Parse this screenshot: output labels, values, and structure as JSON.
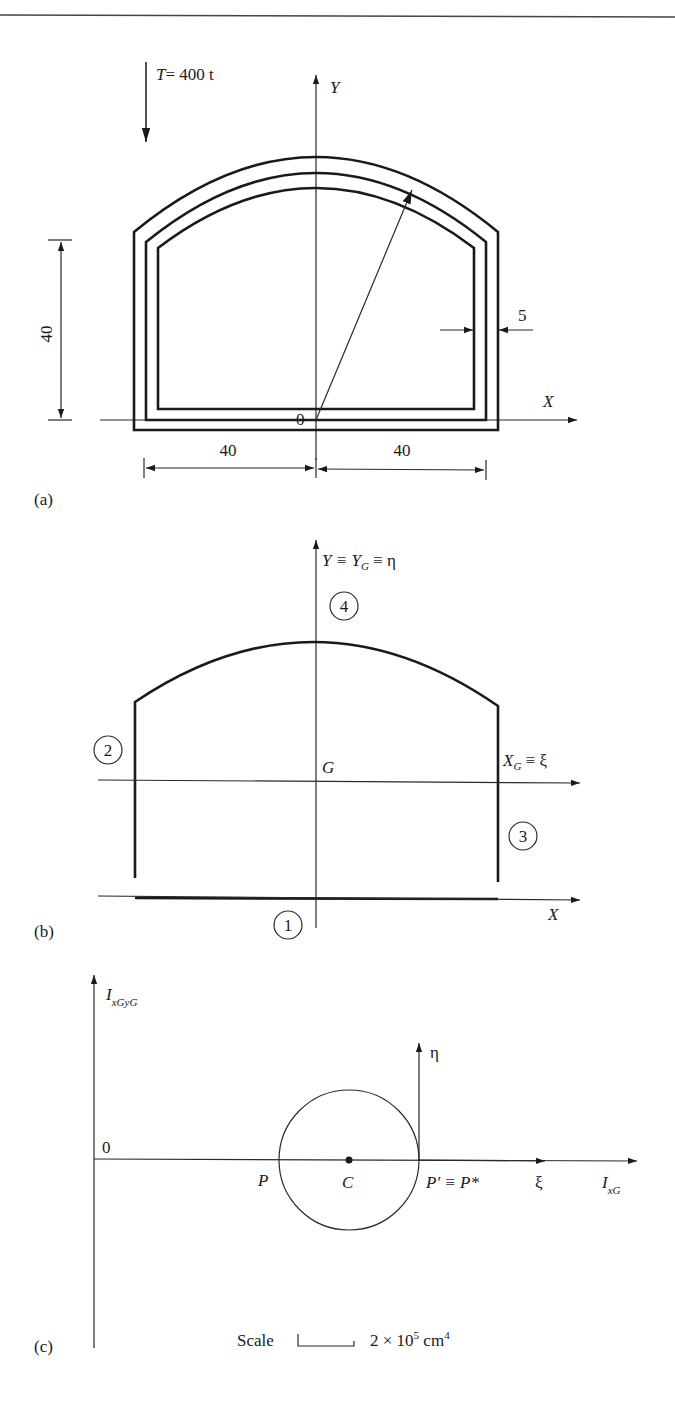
{
  "page": {
    "background": "#ffffff",
    "ink_color": "#1a1a1a"
  },
  "figure_a": {
    "panel_label": "(a)",
    "load_label": "T = 400 t",
    "load_symbol": "T",
    "load_value": "= 400 t",
    "y_axis_label": "Y",
    "x_axis_label": "X",
    "origin_label": "0",
    "height_dim": "40",
    "thickness_dim": "5",
    "left_width_dim": "40",
    "right_width_dim": "40"
  },
  "figure_b": {
    "panel_label": "(b)",
    "y_axis_label": "Y ≡ Y",
    "y_axis_sub": "G",
    "y_axis_tail": " ≡ η",
    "xg_axis_label": "X",
    "xg_axis_sub": "G",
    "xg_axis_tail": " ≡ ξ",
    "x_axis_label": "X",
    "centroid_label": "G",
    "segments": [
      {
        "id": "1",
        "label": "1"
      },
      {
        "id": "2",
        "label": "2"
      },
      {
        "id": "3",
        "label": "3"
      },
      {
        "id": "4",
        "label": "4"
      }
    ]
  },
  "figure_c": {
    "panel_label": "(c)",
    "vertical_axis_label": "I",
    "vertical_axis_sub": "xGyG",
    "horizontal_axis_label": "I",
    "horizontal_axis_sub": "xG",
    "origin_label": "0",
    "eta_label": "η",
    "xi_label": "ξ",
    "point_p": "P",
    "point_c": "C",
    "point_p_prime": "P′ ≡ P*",
    "scale_label": "Scale",
    "scale_value": "2 × 10",
    "scale_exp": "5",
    "scale_unit": " cm",
    "scale_unit_exp": "4"
  }
}
